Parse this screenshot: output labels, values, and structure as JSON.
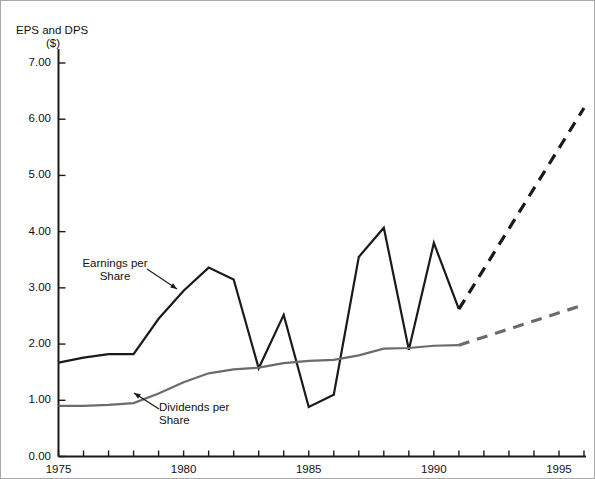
{
  "chart_data": {
    "type": "line",
    "title": "EPS and DPS ($)",
    "title_line1": "EPS and DPS",
    "title_line2": "($)",
    "xlabel": "",
    "ylabel": "EPS and DPS ($)",
    "xlim": [
      1975,
      1996
    ],
    "ylim": [
      0.0,
      7.0
    ],
    "grid": false,
    "legend_position": "inline-annotations",
    "y_ticks": [
      "0.00",
      "1.00",
      "2.00",
      "3.00",
      "4.00",
      "5.00",
      "6.00",
      "7.00"
    ],
    "y_tick_values": [
      0.0,
      1.0,
      2.0,
      3.0,
      4.0,
      5.0,
      6.0,
      7.0
    ],
    "x_ticks_labeled": [
      "1975",
      "1980",
      "1985",
      "1990",
      "1995"
    ],
    "x_tick_values": [
      1975,
      1980,
      1985,
      1990,
      1995
    ],
    "x_minor_tick_values": [
      1975,
      1976,
      1977,
      1978,
      1979,
      1980,
      1981,
      1982,
      1983,
      1984,
      1985,
      1986,
      1987,
      1988,
      1989,
      1990,
      1991,
      1992,
      1993,
      1994,
      1995,
      1996
    ],
    "series": [
      {
        "name": "Earnings per Share",
        "color": "#1a1a1a",
        "style": "solid",
        "x": [
          1975,
          1976,
          1977,
          1978,
          1979,
          1980,
          1981,
          1982,
          1983,
          1984,
          1985,
          1986,
          1987,
          1988,
          1989,
          1990,
          1991
        ],
        "values": [
          1.67,
          1.76,
          1.82,
          1.82,
          2.45,
          2.95,
          3.36,
          3.15,
          1.57,
          2.52,
          0.88,
          1.1,
          3.55,
          4.07,
          1.9,
          3.8,
          2.62
        ]
      },
      {
        "name": "Earnings per Share (projected)",
        "color": "#1a1a1a",
        "style": "dashed",
        "x": [
          1991,
          1996
        ],
        "values": [
          2.62,
          6.2
        ]
      },
      {
        "name": "Dividends per Share",
        "color": "#6b6b6b",
        "style": "solid",
        "x": [
          1975,
          1976,
          1977,
          1978,
          1979,
          1980,
          1981,
          1982,
          1983,
          1984,
          1985,
          1986,
          1987,
          1988,
          1989,
          1990,
          1991
        ],
        "values": [
          0.9,
          0.9,
          0.92,
          0.95,
          1.12,
          1.32,
          1.48,
          1.55,
          1.58,
          1.66,
          1.7,
          1.72,
          1.8,
          1.92,
          1.93,
          1.97,
          1.98
        ]
      },
      {
        "name": "Dividends per Share (projected)",
        "color": "#6b6b6b",
        "style": "dashed",
        "x": [
          1991,
          1996
        ],
        "values": [
          1.98,
          2.7
        ]
      }
    ],
    "annotations": [
      {
        "text": "Earnings per Share",
        "line1": "Earnings per",
        "line2": "Share",
        "points_to_series": "Earnings per Share"
      },
      {
        "text": "Dividends per Share",
        "line1": "Dividends per",
        "line2": "Share",
        "points_to_series": "Dividends per Share"
      }
    ],
    "colors": {
      "eps": "#1a1a1a",
      "dps": "#6b6b6b",
      "axis": "#1a1a1a",
      "background": "#ffffff",
      "frame": "#a8a8a8"
    }
  }
}
